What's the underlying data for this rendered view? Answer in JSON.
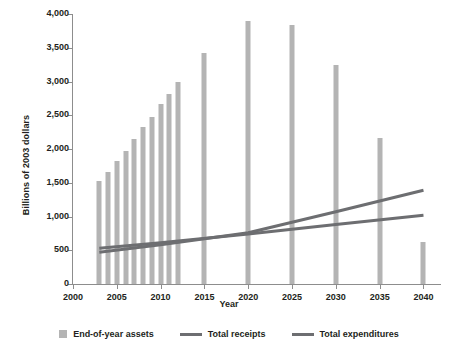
{
  "chart_data": {
    "type": "bar",
    "title": "",
    "xlabel": "Year",
    "ylabel": "Billions of 2003 dollars",
    "xlim": [
      2000,
      2042
    ],
    "ylim": [
      0,
      4000
    ],
    "grid": false,
    "legend_position": "bottom",
    "xticks": [
      2000,
      2005,
      2010,
      2015,
      2020,
      2025,
      2030,
      2035,
      2040
    ],
    "xtick_labels": [
      "2000",
      "2005",
      "2010",
      "2015",
      "2020",
      "2025",
      "2030",
      "2035",
      "2040"
    ],
    "yticks": [
      0,
      500,
      1000,
      1500,
      2000,
      2500,
      3000,
      3500,
      4000
    ],
    "ytick_labels": [
      "0",
      "500",
      "1,000",
      "1,500",
      "2,000",
      "2,500",
      "3,000",
      "3,500",
      "4,000"
    ],
    "bar_series": {
      "name": "End-of-year assets",
      "color": "#b4b4b4",
      "x": [
        2003,
        2004,
        2005,
        2006,
        2007,
        2008,
        2009,
        2010,
        2011,
        2012,
        2015,
        2020,
        2025,
        2030,
        2035,
        2040
      ],
      "values": [
        1530,
        1660,
        1820,
        1970,
        2150,
        2320,
        2480,
        2660,
        2820,
        2990,
        3420,
        3900,
        3830,
        3250,
        2170,
        620
      ]
    },
    "line_series": [
      {
        "name": "Total receipts",
        "color": "#6d6e71",
        "x": [
          2003,
          2010,
          2020,
          2030,
          2040
        ],
        "values": [
          530,
          610,
          740,
          880,
          1020
        ]
      },
      {
        "name": "Total expenditures",
        "color": "#6d6e71",
        "x": [
          2003,
          2010,
          2020,
          2030,
          2040
        ],
        "values": [
          470,
          580,
          760,
          1070,
          1390
        ]
      }
    ]
  },
  "legend": {
    "items": [
      {
        "label": "End-of-year assets",
        "marker": "bar-swatch-icon"
      },
      {
        "label": "Total receipts",
        "marker": "line-swatch-icon"
      },
      {
        "label": "Total expenditures",
        "marker": "line-swatch-icon"
      }
    ]
  }
}
